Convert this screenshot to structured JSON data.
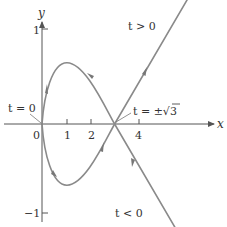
{
  "figure": {
    "type": "parametric-curve",
    "x_axis_label": "x",
    "y_axis_label": "y",
    "x_ticks": [
      {
        "value": 0,
        "label": "0"
      },
      {
        "value": 1,
        "label": "1"
      },
      {
        "value": 2,
        "label": "2"
      },
      {
        "value": 4,
        "label": "4"
      }
    ],
    "y_ticks": [
      {
        "value": 1,
        "label": "1"
      },
      {
        "value": -1,
        "label": "−1"
      }
    ],
    "annotations": {
      "t_zero": "t = 0",
      "t_sqrt3_prefix": "t = ±",
      "t_sqrt3_radicand": "3",
      "t_positive": "t > 0",
      "t_negative": "t < 0"
    },
    "colors": {
      "axis": "#555555",
      "curve": "#8a8a8a",
      "arrow": "#777777",
      "text": "#333333"
    }
  }
}
